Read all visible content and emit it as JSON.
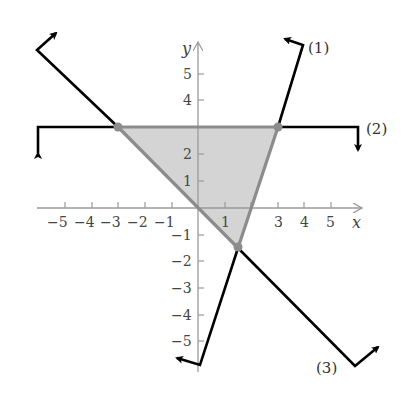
{
  "figure": {
    "type": "graph of system of linear inequalities with shaded feasible triangle",
    "axes": {
      "x_label": "x",
      "y_label": "y",
      "x_ticks": [
        "−5",
        "−4",
        "−3",
        "−2",
        "−1",
        "1",
        "3",
        "4",
        "5"
      ],
      "y_ticks_positive": [
        "1",
        "2",
        "4",
        "5"
      ],
      "y_ticks_negative": [
        "−1",
        "−2",
        "−3",
        "−4",
        "−5"
      ]
    },
    "lines": [
      {
        "id": "1",
        "label": "(1)",
        "equation": "y = 3x − 6"
      },
      {
        "id": "2",
        "label": "(2)",
        "equation": "y = 3"
      },
      {
        "id": "3",
        "label": "(3)",
        "equation": "y = −x"
      }
    ],
    "vertices": [
      {
        "x": -3,
        "y": 3
      },
      {
        "x": 3,
        "y": 3
      },
      {
        "x": 1.5,
        "y": -1.5
      }
    ],
    "colors": {
      "boundary": "#000000",
      "feasible_edge": "#8c8c8c",
      "feasible_fill": "#d4d4d4",
      "axis": "#9a9a9a",
      "vertex": "#8c8c8c"
    }
  }
}
